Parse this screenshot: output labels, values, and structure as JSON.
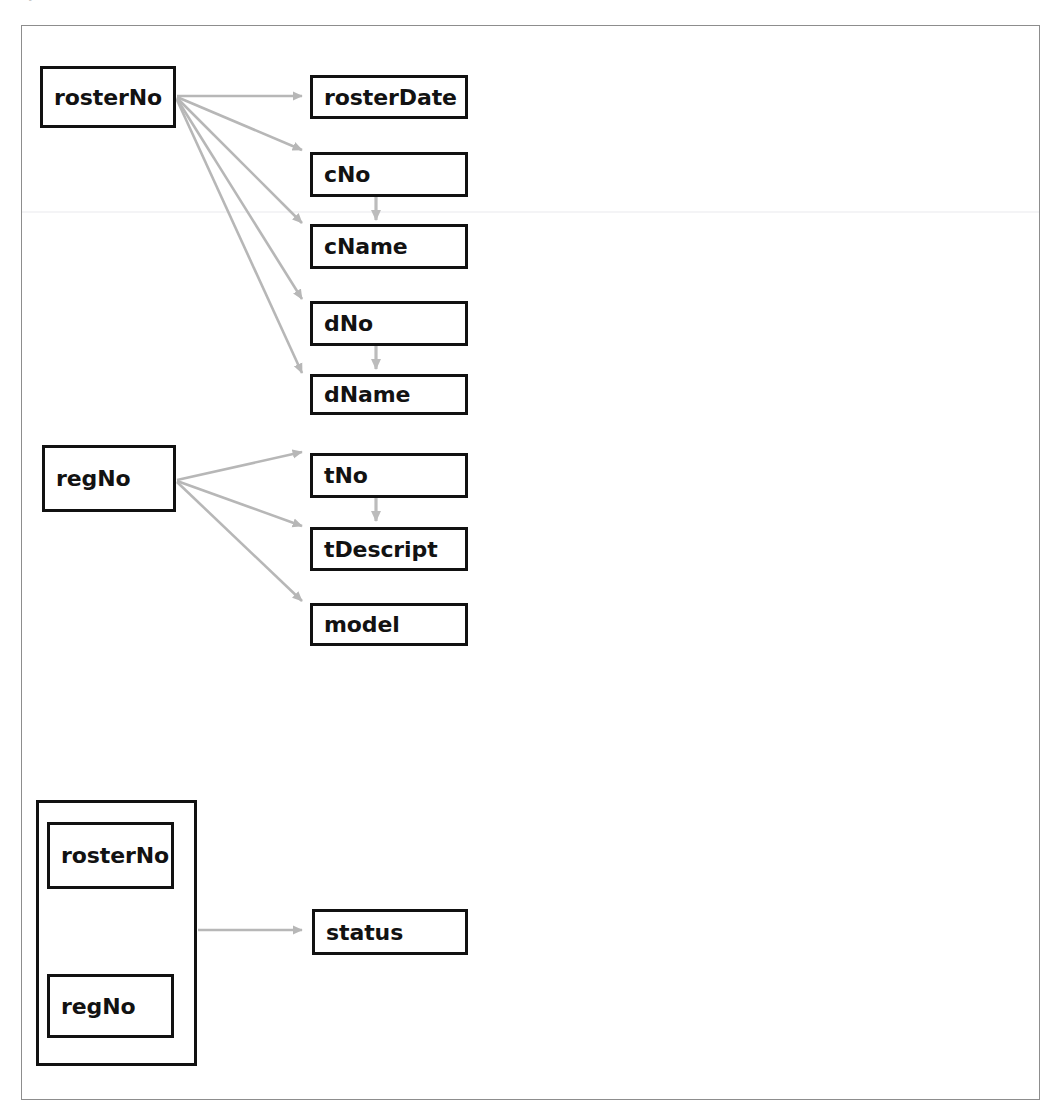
{
  "diagram": {
    "type": "functional-dependency-diagram",
    "title_remnant": "",
    "colors": {
      "box_border": "#111111",
      "box_fill": "#ffffff",
      "arrow": "#b7b7b7",
      "page_frame": "#8d8d8d",
      "background": "#ffffff",
      "text": "#121212"
    },
    "determinants": [
      {
        "id": "det-rosterNo",
        "label": "rosterNo"
      },
      {
        "id": "det-regNo",
        "label": "regNo"
      }
    ],
    "composite_key": {
      "id": "det-composite",
      "members": [
        {
          "id": "comp-rosterNo",
          "label": "rosterNo"
        },
        {
          "id": "comp-regNo",
          "label": "regNo"
        }
      ]
    },
    "dependents": [
      {
        "id": "attr-rosterDate",
        "label": "rosterDate"
      },
      {
        "id": "attr-cNo",
        "label": "cNo"
      },
      {
        "id": "attr-cName",
        "label": "cName"
      },
      {
        "id": "attr-dNo",
        "label": "dNo"
      },
      {
        "id": "attr-dName",
        "label": "dName"
      },
      {
        "id": "attr-tNo",
        "label": "tNo"
      },
      {
        "id": "attr-tDescript",
        "label": "tDescript"
      },
      {
        "id": "attr-model",
        "label": "model"
      },
      {
        "id": "attr-status",
        "label": "status"
      }
    ],
    "dependencies": [
      {
        "from": "rosterNo",
        "to": "rosterDate"
      },
      {
        "from": "rosterNo",
        "to": "cNo"
      },
      {
        "from": "rosterNo",
        "to": "cName"
      },
      {
        "from": "rosterNo",
        "to": "dNo"
      },
      {
        "from": "rosterNo",
        "to": "dName"
      },
      {
        "from": "cNo",
        "to": "cName"
      },
      {
        "from": "dNo",
        "to": "dName"
      },
      {
        "from": "regNo",
        "to": "tNo"
      },
      {
        "from": "regNo",
        "to": "tDescript"
      },
      {
        "from": "regNo",
        "to": "model"
      },
      {
        "from": "tNo",
        "to": "tDescript"
      },
      {
        "from": "rosterNo, regNo",
        "to": "status"
      }
    ]
  }
}
